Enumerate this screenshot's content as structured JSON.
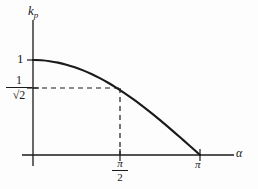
{
  "figure": {
    "name": "pitch-factor-curve",
    "background_color": "#fdfdfd",
    "line_color": "#1a1a1a"
  },
  "axes": {
    "y_axis_label": "k",
    "y_axis_label_subscript": "p",
    "x_axis_label": "α"
  },
  "ticks": {
    "y": [
      {
        "label": "1",
        "value": 1
      },
      {
        "label": "1/√2",
        "numerator": "1",
        "denominator": "√2",
        "value": 0.7071
      }
    ],
    "x": [
      {
        "label": "π/2",
        "numerator": "π",
        "denominator": "2",
        "value": 1.5708
      },
      {
        "label": "π",
        "value": 3.1416
      }
    ]
  },
  "annotations": {
    "horizontal_guide": "dashed line at k_p = 1/√2",
    "vertical_guide": "dashed line at α = π/2"
  },
  "chart_data": {
    "type": "line",
    "title": "",
    "xlabel": "α",
    "ylabel": "k_p",
    "xlim": [
      0,
      3.665
    ],
    "ylim": [
      0,
      1.18
    ],
    "grid": false,
    "legend": null,
    "equation": "k_p = cos(α/2)",
    "x_tick_labels": [
      "π/2",
      "π"
    ],
    "x_tick_values": [
      1.5708,
      3.1416
    ],
    "y_tick_labels": [
      "1",
      "1/√2"
    ],
    "y_tick_values": [
      1.0,
      0.7071
    ],
    "series": [
      {
        "name": "k_p",
        "x": [
          0.0,
          0.1571,
          0.3142,
          0.4712,
          0.6283,
          0.7854,
          0.9425,
          1.0996,
          1.2566,
          1.4137,
          1.5708,
          1.7279,
          1.885,
          2.042,
          2.1991,
          2.3562,
          2.5133,
          2.6704,
          2.8274,
          2.9845,
          3.1416
        ],
        "y": [
          1.0,
          0.9969,
          0.9877,
          0.9724,
          0.9511,
          0.9239,
          0.891,
          0.8526,
          0.809,
          0.7604,
          0.7071,
          0.6494,
          0.5878,
          0.5225,
          0.454,
          0.3827,
          0.309,
          0.2334,
          0.1564,
          0.0785,
          0.0
        ]
      }
    ],
    "markers": [
      {
        "x": 1.5708,
        "y": 0.7071,
        "label": "(π/2, 1/√2)",
        "style": "dashed-guides"
      }
    ]
  }
}
